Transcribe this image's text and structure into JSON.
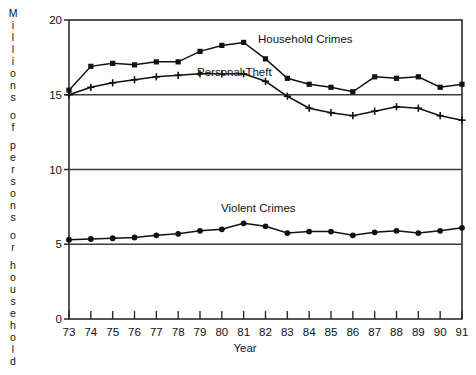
{
  "chart_data": {
    "type": "line",
    "title": "",
    "xlabel": "Year",
    "ylabel": "Millions of persons or household",
    "x": [
      73,
      74,
      75,
      76,
      77,
      78,
      79,
      80,
      81,
      82,
      83,
      84,
      85,
      86,
      87,
      88,
      89,
      90,
      91
    ],
    "xtick_labels": [
      "73",
      "74",
      "75",
      "76",
      "77",
      "78",
      "79",
      "80",
      "81",
      "82",
      "83",
      "84",
      "85",
      "86",
      "87",
      "88",
      "89",
      "90",
      "91"
    ],
    "ytick_labels": [
      "0",
      "5",
      "10",
      "15",
      "20"
    ],
    "ytick_values": [
      0,
      5,
      10,
      15,
      20
    ],
    "xlim": [
      73,
      91
    ],
    "ylim": [
      0,
      20
    ],
    "grid": true,
    "grid_orientation": "horizontal",
    "legend": "inline-annotations",
    "series": [
      {
        "name": "Household Crimes",
        "marker": "square",
        "color": "#111111",
        "values": [
          15.3,
          16.9,
          17.1,
          17.0,
          17.2,
          17.2,
          17.9,
          18.3,
          18.5,
          17.4,
          16.1,
          15.7,
          15.5,
          15.2,
          16.2,
          16.1,
          16.2,
          15.5,
          15.7
        ]
      },
      {
        "name": "Personal Theft",
        "marker": "plus",
        "color": "#111111",
        "values": [
          15.0,
          15.5,
          15.8,
          16.0,
          16.2,
          16.3,
          16.4,
          16.4,
          16.4,
          15.9,
          14.9,
          14.1,
          13.8,
          13.6,
          13.9,
          14.2,
          14.1,
          13.6,
          13.3
        ]
      },
      {
        "name": "Violent Crimes",
        "marker": "circle",
        "color": "#111111",
        "values": [
          5.3,
          5.35,
          5.4,
          5.45,
          5.6,
          5.7,
          5.9,
          6.0,
          6.4,
          6.2,
          5.75,
          5.85,
          5.85,
          5.6,
          5.8,
          5.9,
          5.75,
          5.9,
          6.1
        ]
      }
    ],
    "annotations": [
      {
        "text": "Household Crimes",
        "x_px": 258,
        "y_px": 43
      },
      {
        "text": "Personal Theft",
        "x_px": 197,
        "y_px": 76
      },
      {
        "text": "Violent Crimes",
        "x_px": 221,
        "y_px": 212
      }
    ]
  },
  "axis": {
    "y_title_chars": [
      "M",
      "i",
      "l",
      "l",
      "i",
      "o",
      "n",
      "s",
      "",
      "o",
      "f",
      "",
      "p",
      "e",
      "r",
      "s",
      "o",
      "n",
      "s",
      "",
      "o",
      "r",
      "",
      "h",
      "o",
      "u",
      "s",
      "e",
      "h",
      "o",
      "l",
      "d"
    ],
    "x_title": "Year"
  }
}
